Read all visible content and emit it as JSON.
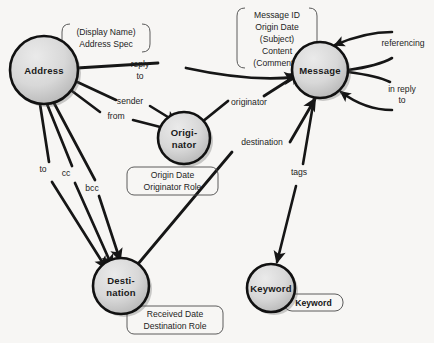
{
  "diagram": {
    "background_color": "#f7f6f4",
    "node_fill_light": "#e2e2e2",
    "node_fill_dark": "#b9b9b9",
    "node_stroke": "#111111",
    "edge_color": "#161616",
    "annotation_stroke": "#4a4a4a",
    "nodes": [
      {
        "id": "address",
        "label": "Address",
        "label_lines": [
          "Address"
        ],
        "cx": 44,
        "cy": 70,
        "r": 34
      },
      {
        "id": "originator",
        "label": "Originator",
        "label_lines": [
          "Origi-",
          "nator"
        ],
        "cx": 184,
        "cy": 138,
        "r": 26
      },
      {
        "id": "message",
        "label": "Message",
        "label_lines": [
          "Message"
        ],
        "cx": 320,
        "cy": 70,
        "r": 28
      },
      {
        "id": "destination",
        "label": "Destination",
        "label_lines": [
          "Desti-",
          "nation"
        ],
        "cx": 121,
        "cy": 286,
        "r": 28
      },
      {
        "id": "keyword",
        "label": "Keyword",
        "label_lines": [
          "Keyword"
        ],
        "cx": 271,
        "cy": 288,
        "r": 24
      }
    ],
    "edge_labels": [
      {
        "id": "reply-to",
        "lines": [
          "reply",
          "to"
        ],
        "x": 140,
        "y": 67
      },
      {
        "id": "sender",
        "lines": [
          "sender"
        ],
        "x": 130,
        "y": 104
      },
      {
        "id": "from",
        "lines": [
          "from"
        ],
        "x": 116,
        "y": 119
      },
      {
        "id": "to",
        "lines": [
          "to"
        ],
        "x": 43,
        "y": 172
      },
      {
        "id": "cc",
        "lines": [
          "cc"
        ],
        "x": 66,
        "y": 176
      },
      {
        "id": "bcc",
        "lines": [
          "bcc"
        ],
        "x": 92,
        "y": 191
      },
      {
        "id": "originator-edge",
        "lines": [
          "originator"
        ],
        "x": 249,
        "y": 105
      },
      {
        "id": "destination-edge",
        "lines": [
          "destination"
        ],
        "x": 262,
        "y": 145
      },
      {
        "id": "referencing",
        "lines": [
          "referencing"
        ],
        "x": 403,
        "y": 46
      },
      {
        "id": "in-reply-to",
        "lines": [
          "in reply",
          "to"
        ],
        "x": 402,
        "y": 92
      },
      {
        "id": "tags",
        "lines": [
          "tags"
        ],
        "x": 299,
        "y": 175
      }
    ],
    "annotations": [
      {
        "id": "address-attributes",
        "lines": [
          "(Display Name)",
          "Address Spec"
        ],
        "x": 62,
        "y": 24,
        "w": 88,
        "h": 28,
        "style": "bracket"
      },
      {
        "id": "message-attributes",
        "lines": [
          "Message ID",
          "Origin Date",
          "(Subject)",
          "Content",
          "(Comments)"
        ],
        "x": 237,
        "y": 8,
        "w": 80,
        "h": 60,
        "style": "bracket"
      },
      {
        "id": "originator-attributes",
        "lines": [
          "Origin Date",
          "Originator Role"
        ],
        "x": 127,
        "y": 167,
        "w": 91,
        "h": 28,
        "style": "rounded"
      },
      {
        "id": "destination-attributes",
        "lines": [
          "Received Date",
          "Destination Role"
        ],
        "x": 127,
        "y": 306,
        "w": 96,
        "h": 28,
        "style": "rounded"
      },
      {
        "id": "keyword-attributes",
        "lines": [
          "Keyword"
        ],
        "x": 284,
        "y": 294,
        "w": 59,
        "h": 17,
        "style": "rounded",
        "bold": true
      }
    ]
  }
}
